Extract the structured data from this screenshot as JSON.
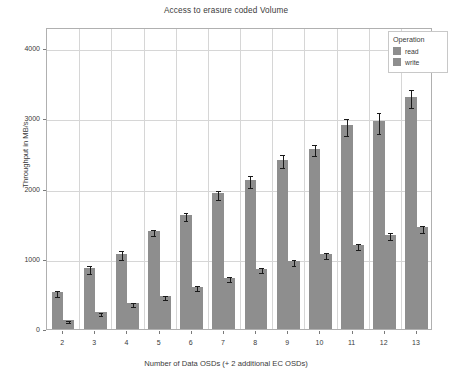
{
  "chart_data": {
    "type": "bar",
    "title": "Access to erasure coded Volume",
    "xlabel": "Number of Data OSDs (+ 2 additional EC OSDs)",
    "ylabel": "Throughput in MB/s",
    "categories": [
      "2",
      "3",
      "4",
      "5",
      "6",
      "7",
      "8",
      "9",
      "10",
      "11",
      "12",
      "13"
    ],
    "ylim": [
      0,
      4300
    ],
    "yticks": [
      0,
      1000,
      2000,
      3000,
      4000
    ],
    "ytick_labels": [
      "0",
      "1000",
      "2000",
      "3000",
      "4000"
    ],
    "grid": true,
    "legend_position": "upper right",
    "legend_title": "Operation",
    "series": [
      {
        "name": "read",
        "color": "#8e8e8e",
        "values": [
          530,
          870,
          1070,
          1400,
          1620,
          1930,
          2120,
          2410,
          2570,
          2900,
          2960,
          3300
        ],
        "errors": [
          45,
          55,
          65,
          45,
          55,
          70,
          80,
          95,
          85,
          120,
          150,
          130
        ]
      },
      {
        "name": "write",
        "color": "#8e8e8e",
        "values": [
          130,
          240,
          370,
          470,
          600,
          730,
          860,
          970,
          1070,
          1200,
          1340,
          1450
        ],
        "errors": [
          18,
          20,
          30,
          30,
          35,
          35,
          40,
          45,
          45,
          45,
          50,
          50
        ]
      }
    ]
  },
  "legend": {
    "title": "Operation",
    "items": [
      {
        "label": "read",
        "color": "#8e8e8e"
      },
      {
        "label": "write",
        "color": "#8e8e8e"
      }
    ]
  }
}
